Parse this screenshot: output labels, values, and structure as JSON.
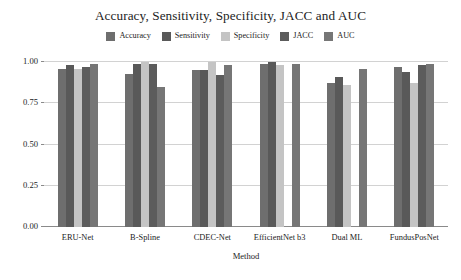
{
  "chart_data": {
    "type": "bar",
    "title": "Accuracy, Sensitivity, Specificity, JACC and AUC",
    "xlabel": "Method",
    "ylabel": "",
    "ylim": [
      0.0,
      1.0
    ],
    "yticks": [
      "0.00",
      "0.25",
      "0.50",
      "0.75",
      "1.00"
    ],
    "ytick_values": [
      0.0,
      0.25,
      0.5,
      0.75,
      1.0
    ],
    "grid": true,
    "legend_position": "top",
    "categories": [
      "ERU-Net",
      "B-Spline",
      "CDEC-Net",
      "EfficientNet b3",
      "Dual ML",
      "FundusPosNet"
    ],
    "series": [
      {
        "name": "Accuracy",
        "color": "#6e6e6e",
        "values": [
          0.96,
          0.93,
          0.95,
          0.99,
          0.87,
          0.97
        ]
      },
      {
        "name": "Sensitivity",
        "color": "#595959",
        "values": [
          0.98,
          0.99,
          0.95,
          1.0,
          0.91,
          0.94
        ]
      },
      {
        "name": "Specificity",
        "color": "#c4c4c4",
        "values": [
          0.96,
          1.0,
          1.0,
          0.98,
          0.86,
          0.87
        ]
      },
      {
        "name": "JACC",
        "color": "#5c5c5c",
        "values": [
          0.97,
          0.99,
          0.92,
          0.0,
          0.0,
          0.98
        ]
      },
      {
        "name": "AUC",
        "color": "#767676",
        "values": [
          0.99,
          0.85,
          0.98,
          0.99,
          0.96,
          0.99
        ]
      }
    ]
  }
}
